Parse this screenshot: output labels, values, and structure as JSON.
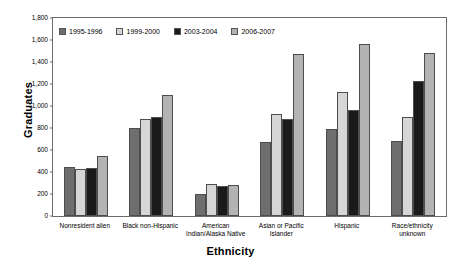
{
  "chart_data": {
    "type": "bar",
    "title": "",
    "xlabel": "Ethnicity",
    "ylabel": "Graduates",
    "ylim": [
      0,
      1800
    ],
    "ytick_step": 200,
    "yticks": [
      "1,800",
      "1,600",
      "1,400",
      "1,200",
      "1,000",
      "800",
      "600",
      "400",
      "200",
      "0"
    ],
    "grid": false,
    "legend_position": "top-left-inside",
    "categories": [
      "Nonresident alien",
      "Black non-Hispanic",
      "American\nIndian/Alaska Native",
      "Asian or Pacific\nIslander",
      "Hispanic",
      "Race/ethnicity\nunknown"
    ],
    "category_lines": [
      [
        "Nonresident alien"
      ],
      [
        "Black non-Hispanic"
      ],
      [
        "American",
        "Indian/Alaska Native"
      ],
      [
        "Asian or Pacific",
        "Islander"
      ],
      [
        "Hispanic"
      ],
      [
        "Race/ethnicity",
        "unknown"
      ]
    ],
    "series": [
      {
        "name": "1995-1996",
        "color": "#6e6e6e",
        "values": [
          450,
          800,
          200,
          670,
          790,
          680
        ]
      },
      {
        "name": "1999-2000",
        "color": "#d6d6d6",
        "values": [
          430,
          880,
          290,
          930,
          1130,
          900
        ]
      },
      {
        "name": "2003-2004",
        "color": "#1a1a1a",
        "values": [
          440,
          900,
          270,
          880,
          960,
          1230
        ]
      },
      {
        "name": "2006-2007",
        "color": "#b3b3b3",
        "values": [
          550,
          1100,
          280,
          1470,
          1560,
          1480
        ]
      }
    ]
  }
}
